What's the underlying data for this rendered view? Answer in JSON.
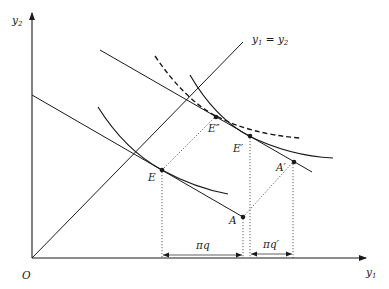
{
  "diagram": {
    "axes": {
      "origin_label": "O",
      "x_label": "y",
      "x_label_sub": "1",
      "y_label": "y",
      "y_label_sub": "2"
    },
    "diagonal_label": {
      "lhs": "y",
      "lhs_sub": "1",
      "eq": " = ",
      "rhs": "y",
      "rhs_sub": "2"
    },
    "points": {
      "E": "E",
      "A": "A",
      "E_double_prime": "E″",
      "E_prime": "E′",
      "A_prime": "A′"
    },
    "brackets": {
      "pi_q": "πq",
      "pi_q_prime": "πq′"
    },
    "colors": {
      "ink": "#1a1a1a",
      "background": "#ffffff"
    }
  }
}
